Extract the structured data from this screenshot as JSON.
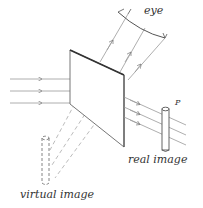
{
  "labels": {
    "eye": "eye",
    "point": "P",
    "real_image": "real image",
    "virtual_image": "virtual image"
  },
  "colors": {
    "ink": "#555555",
    "ray": "#888888",
    "mirror_edge": "#333333",
    "background": "#ffffff"
  }
}
